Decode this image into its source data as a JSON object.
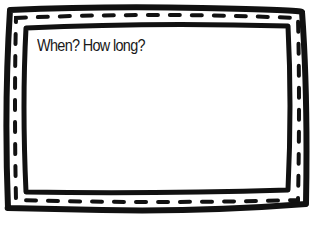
{
  "card": {
    "prompt": "When? How long?",
    "border_color": "#111111",
    "background": "#ffffff"
  }
}
